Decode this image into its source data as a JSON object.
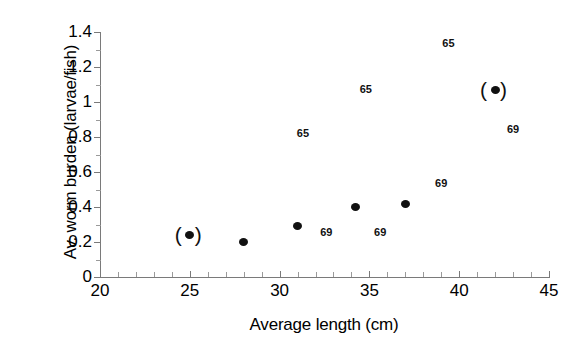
{
  "chart_data": {
    "type": "scatter",
    "title": "",
    "xlabel": "Average length (cm)",
    "ylabel": "Av. worm burden (larvae/fish)",
    "xlim": [
      20,
      45
    ],
    "ylim": [
      0,
      1.4
    ],
    "xticks": [
      20,
      25,
      30,
      35,
      40,
      45
    ],
    "xtick_labels": [
      "20",
      "25",
      "30",
      "35",
      "40",
      "45"
    ],
    "xtick_minor": [
      21,
      22,
      23,
      24,
      26,
      27,
      28,
      29,
      31,
      32,
      33,
      34,
      36,
      37,
      38,
      39,
      41,
      42,
      43,
      44
    ],
    "yticks": [
      0,
      0.2,
      0.4,
      0.6,
      0.8,
      1,
      1.2,
      1.4
    ],
    "ytick_labels": [
      "0",
      "0.2",
      "0.4",
      "0.6",
      "0.8",
      "1",
      "1.2",
      "1.4"
    ],
    "ytick_minor": [
      0.1,
      0.3,
      0.5,
      0.7,
      0.9,
      1.1,
      1.3
    ],
    "grid": false,
    "legend": null,
    "points": [
      {
        "x": 25.0,
        "y": 0.24,
        "marker": "filled-circle",
        "parenthesized": true
      },
      {
        "x": 28.0,
        "y": 0.2,
        "marker": "filled-circle",
        "parenthesized": false
      },
      {
        "x": 31.0,
        "y": 0.29,
        "marker": "filled-circle",
        "parenthesized": false
      },
      {
        "x": 34.2,
        "y": 0.4,
        "marker": "filled-circle",
        "parenthesized": false
      },
      {
        "x": 37.0,
        "y": 0.42,
        "marker": "filled-circle",
        "parenthesized": false
      },
      {
        "x": 42.0,
        "y": 1.07,
        "marker": "filled-circle",
        "parenthesized": true
      }
    ],
    "annotations": [
      {
        "text": "65",
        "x": 31.3,
        "y": 0.82
      },
      {
        "text": "65",
        "x": 34.8,
        "y": 1.07
      },
      {
        "text": "65",
        "x": 39.4,
        "y": 1.33
      },
      {
        "text": "69",
        "x": 32.6,
        "y": 0.25
      },
      {
        "text": "69",
        "x": 35.6,
        "y": 0.25
      },
      {
        "text": "69",
        "x": 39.0,
        "y": 0.53
      },
      {
        "text": "69",
        "x": 43.0,
        "y": 0.84
      }
    ]
  },
  "colors": {
    "marker": "#111111",
    "axis": "#7a7a7a",
    "text": "#000000",
    "background": "#ffffff"
  }
}
